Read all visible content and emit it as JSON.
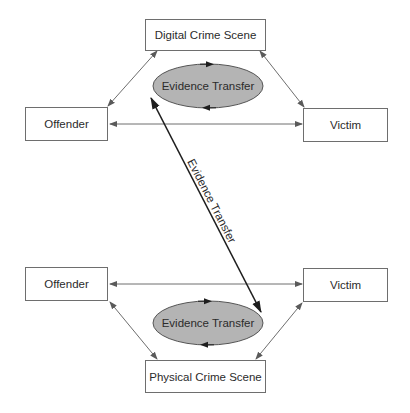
{
  "diagram": {
    "digital": {
      "scene_label": "Digital Crime Scene",
      "offender_label": "Offender",
      "victim_label": "Victim",
      "transfer_label": "Evidence Transfer"
    },
    "physical": {
      "scene_label": "Physical Crime Scene",
      "offender_label": "Offender",
      "victim_label": "Victim",
      "transfer_label": "Evidence Transfer"
    },
    "link_label": "Evidence Transfer",
    "colors": {
      "ellipse_fill": "#b4b4b4",
      "stroke": "#6e6e6e",
      "bold_arrow": "#1e1e1e"
    }
  }
}
